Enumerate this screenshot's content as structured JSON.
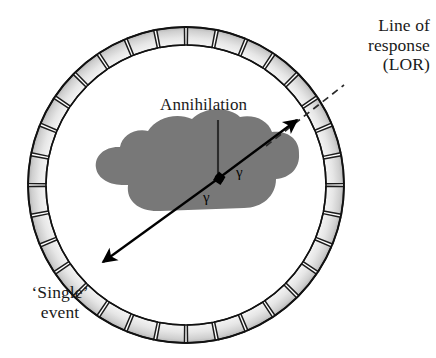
{
  "figure": {
    "background_color": "#ffffff"
  },
  "labels": {
    "lor": "Line of\nresponse\n(LOR)",
    "single_event": "‘Single’\nevent",
    "annihilation": "Annihilation",
    "gamma_upper": "γ",
    "gamma_lower": "γ"
  },
  "colors": {
    "ink": "#1a1a1a",
    "stroke": "#141414",
    "detector_fill_light": "#ebebeb",
    "detector_fill_dark": "#bdbdbd",
    "detector_border": "#1b1b1b",
    "ring_outline": "#111111",
    "patient_fill": "#787878",
    "annihilation_point": "#000000",
    "background": "#ffffff"
  },
  "diagram": {
    "type": "schematic",
    "ring": {
      "name": "detector-ring",
      "center_x": 186,
      "center_y": 185,
      "outer_radius": 158,
      "inner_radius": 140,
      "detector_count": 32,
      "gap_degrees": 1.1
    },
    "patient": {
      "name": "patient-cross-section",
      "description": "cloud-shaped gray body cross section",
      "bounds": {
        "x": 95,
        "y": 128,
        "width": 205,
        "height": 94
      }
    },
    "annihilation_point": {
      "x": 219,
      "y": 178,
      "size": 11
    },
    "gamma_ray_upper": {
      "name": "gamma-ray-upper-right",
      "from": {
        "x": 219,
        "y": 178
      },
      "to": {
        "x": 298,
        "y": 119
      },
      "arrowhead": "end"
    },
    "gamma_ray_lower": {
      "name": "gamma-ray-lower-left",
      "from": {
        "x": 219,
        "y": 178
      },
      "to": {
        "x": 101,
        "y": 263
      },
      "arrowhead": "end"
    },
    "lor_dashed": {
      "name": "line-of-response-dashed",
      "from": {
        "x": 266,
        "y": 146
      },
      "to": {
        "x": 344,
        "y": 85
      },
      "dash": "7 5"
    },
    "annihilation_leader": {
      "name": "annihilation-leader-line",
      "from": {
        "x": 218,
        "y": 120
      },
      "to": {
        "x": 218,
        "y": 174
      }
    }
  }
}
